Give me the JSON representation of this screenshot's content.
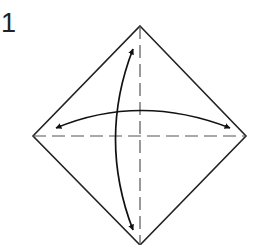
{
  "diagram": {
    "step_number": "1",
    "colors": {
      "line": "#222222",
      "dashed": "#555555",
      "background": "#ffffff"
    },
    "square": {
      "top": [
        140,
        26
      ],
      "right": [
        246,
        136
      ],
      "bottom": [
        140,
        245
      ],
      "left": [
        33,
        136
      ]
    },
    "creases": [
      {
        "type": "valley-fold-dashed",
        "orientation": "vertical",
        "from": [
          140,
          26
        ],
        "to": [
          140,
          245
        ]
      },
      {
        "type": "valley-fold-dashed",
        "orientation": "horizontal",
        "from": [
          33,
          136
        ],
        "to": [
          246,
          136
        ]
      }
    ],
    "arrows": [
      {
        "type": "fold-and-unfold",
        "orientation": "vertical",
        "from": [
          133,
          47
        ],
        "to": [
          133,
          232
        ]
      },
      {
        "type": "fold-and-unfold",
        "orientation": "horizontal",
        "from": [
          54,
          128
        ],
        "to": [
          232,
          128
        ]
      }
    ]
  }
}
